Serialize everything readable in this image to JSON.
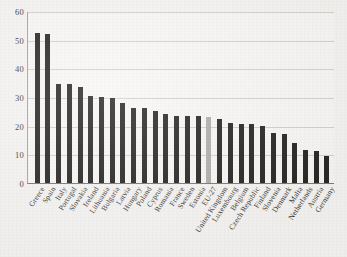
{
  "chart": {
    "title": "",
    "subtitle": "",
    "xlabel": "",
    "ylabel": ""
  },
  "axis": {
    "y_ticks": [
      "0",
      "10",
      "20",
      "30",
      "40",
      "50",
      "60"
    ]
  },
  "chart_data": {
    "type": "bar",
    "title": "",
    "xlabel": "",
    "ylabel": "",
    "ylim": [
      0,
      60
    ],
    "grid": true,
    "legend": "none",
    "highlight_category": "EU-27",
    "highlight_color": "#a9a7a3",
    "bar_color": "#121110",
    "categories": [
      "Greece",
      "Spain",
      "Italy",
      "Portugal",
      "Slovakia",
      "Ireland",
      "Lithuania",
      "Bulgaria",
      "Latvia",
      "Hungary",
      "Poland",
      "Cyprus",
      "Romania",
      "France",
      "Sweden",
      "Estonia",
      "EU-27",
      "United Kingdom",
      "Luxembourg",
      "Belgium",
      "Czech Republic",
      "Finland",
      "Slovenia",
      "Denmark",
      "Malta",
      "Netherlands",
      "Austria",
      "Germany"
    ],
    "values": [
      52.5,
      52.0,
      34.5,
      34.5,
      33.5,
      30.5,
      30.0,
      29.5,
      28.0,
      26.0,
      26.0,
      25.0,
      24.0,
      23.5,
      23.5,
      23.5,
      23.0,
      22.5,
      21.0,
      20.5,
      20.5,
      20.0,
      17.5,
      17.0,
      14.0,
      11.5,
      11.0,
      9.5
    ]
  }
}
